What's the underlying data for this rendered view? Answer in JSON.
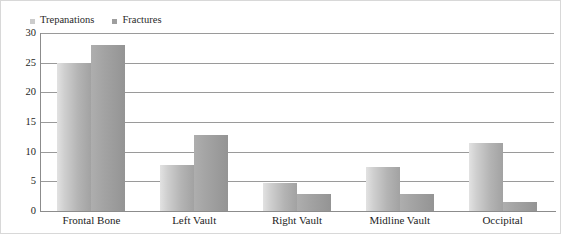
{
  "chart_data": {
    "type": "bar",
    "title": "",
    "subtitle": "",
    "xlabel": "",
    "ylabel": "",
    "grid": true,
    "legend_position": "top-left",
    "categories": [
      "Frontal Bone",
      "Left Vault",
      "Right Vault",
      "Midline Vault",
      "Occipital"
    ],
    "ylim": [
      0,
      30
    ],
    "yticks": [
      0,
      5,
      10,
      15,
      20,
      25,
      30
    ],
    "ytick_labels": [
      "0",
      "5",
      "10",
      "15",
      "20",
      "25",
      "30"
    ],
    "series": [
      {
        "name": "Trepanations",
        "color": "#c2c2c2",
        "values": [
          25,
          7.7,
          4.7,
          7.5,
          11.5
        ]
      },
      {
        "name": "Fractures",
        "color": "#9e9e9e",
        "values": [
          28,
          12.8,
          2.9,
          2.9,
          1.6
        ]
      }
    ]
  },
  "legend": {
    "entries": [
      {
        "label": "Trepanations",
        "swatch": "#cccccc"
      },
      {
        "label": "Fractures",
        "swatch": "#9e9e9e"
      }
    ]
  }
}
